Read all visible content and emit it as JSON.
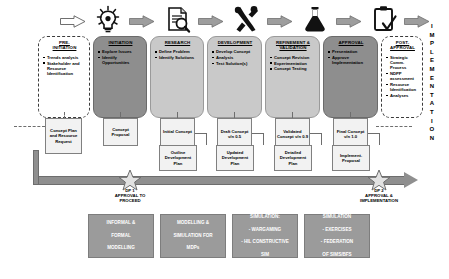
{
  "diagram": {
    "vertical_label": "IMPLEMENTATION",
    "icons": [
      {
        "name": "arrow-icon",
        "label": "arrow"
      },
      {
        "name": "lightbulb-icon",
        "label": "idea"
      },
      {
        "name": "document-search-icon",
        "label": "research"
      },
      {
        "name": "tools-icon",
        "label": "development"
      },
      {
        "name": "flask-icon",
        "label": "validation"
      },
      {
        "name": "clipboard-check-icon",
        "label": "approval"
      }
    ],
    "phases": [
      {
        "title": "PRE-\nINITIATION",
        "title_line1": "PRE-",
        "title_line2": "INITIATION",
        "style": "dashed",
        "bullets": [
          "Trends analysis",
          "Stakeholder and Resource Identification"
        ]
      },
      {
        "title_line1": "INITIATION",
        "title_line2": "",
        "style": "dark",
        "bullets": [
          "Explore Issues",
          "Identify Opportunities"
        ]
      },
      {
        "title_line1": "RESEARCH",
        "title_line2": "",
        "style": "light",
        "bullets": [
          "Define Problem",
          "Identify Solutions"
        ]
      },
      {
        "title_line1": "DEVELOPMENT",
        "title_line2": "",
        "style": "light",
        "bullets": [
          "Develop Concept",
          "Analysis",
          "Test Solution(s)"
        ]
      },
      {
        "title_line1": "REFINEMENT &",
        "title_line2": "VALIDATION",
        "style": "light",
        "bullets": [
          "Concept Revision",
          "Experimentation",
          "Concept Testing"
        ]
      },
      {
        "title_line1": "APPROVAL",
        "title_line2": "",
        "style": "dark",
        "bullets": [
          "Presentation",
          "Approve Implementation"
        ]
      },
      {
        "title_line1": "POST-",
        "title_line2": "APPROVAL",
        "style": "dashed",
        "bullets": [
          "Strategic Comm. Process",
          "NDPP assessment",
          "Resource Identification",
          "Analyses"
        ]
      }
    ],
    "deliverables_upper": [
      {
        "text": "Concept Plan and Resource Request"
      },
      {
        "text": "Concept Proposal"
      },
      {
        "text": "Initial Concept"
      },
      {
        "text": "Draft Concept v/n 0.5"
      },
      {
        "text": "Validated Concept v/n 0.9"
      },
      {
        "text": "Final Concept v/n 1.0"
      }
    ],
    "deliverables_lower": [
      {
        "text": "Outline Development Plan"
      },
      {
        "text": "Updated Development Plan"
      },
      {
        "text": "Detailed Development Plan"
      },
      {
        "text": "Implement. Proposal"
      }
    ],
    "gates": [
      {
        "code": "DP 1",
        "label_line1": "APPROVAL TO",
        "label_line2": "PROCEED"
      },
      {
        "code": "DP 2",
        "label_line1": "APPROVAL &",
        "label_line2": "IMPLEMENTATION"
      }
    ],
    "method_boxes": [
      {
        "lines": [
          "INFORMAL &",
          "FORMAL",
          "MODELLING"
        ]
      },
      {
        "lines": [
          "MODELLING &",
          "SIMULATION FOR",
          "MDPs"
        ]
      },
      {
        "lines": [
          "SIMULATION:",
          "- WARGAMING",
          "- HIL CONSTRUCTIVE",
          "SIM"
        ]
      },
      {
        "lines": [
          "SIMULATION",
          "- EXERCISES",
          "- FEDERATION",
          "OF SIMS/BFS"
        ]
      }
    ],
    "colors": {
      "dark_phase": "#8e8e8e",
      "light_phase": "#c9c9c9",
      "bar": "#8f8f8f",
      "method_box": "#9b9b9b"
    }
  }
}
